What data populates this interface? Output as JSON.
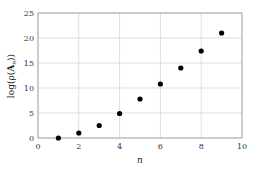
{
  "chart_data": {
    "type": "scatter",
    "title": "",
    "xlabel": "n",
    "ylabel": "log(ρ(A_n))",
    "xlim": [
      0,
      10
    ],
    "ylim": [
      0,
      25
    ],
    "xticks": [
      0,
      2,
      4,
      6,
      8,
      10
    ],
    "yticks": [
      0,
      5,
      10,
      15,
      20,
      25
    ],
    "grid": true,
    "legend": null,
    "series": [
      {
        "name": "log(ρ(A_n))",
        "x": [
          1,
          2,
          3,
          4,
          5,
          6,
          7,
          8,
          9
        ],
        "y": [
          0.0,
          1.0,
          2.5,
          4.9,
          7.8,
          10.8,
          14.0,
          17.4,
          21.0
        ]
      }
    ]
  },
  "labels": {
    "x": "n",
    "y_prefix": "log(ρ(",
    "y_bold": "A",
    "y_sub": "n",
    "y_suffix": "))"
  },
  "colors": {
    "points": "#000000",
    "grid": "#d0d0d0",
    "axes": "#888888"
  }
}
